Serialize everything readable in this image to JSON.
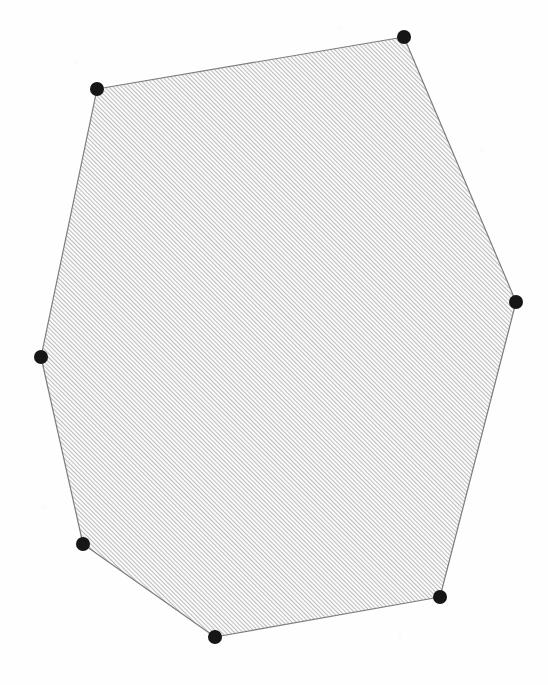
{
  "document": {
    "title": "Hatched Convex Polygon",
    "background_color": "#fefefe",
    "width": 548,
    "height": 685
  },
  "figure": {
    "name": "hatched-heptagon",
    "shape_type": "convex polygon",
    "vertex_count": 7,
    "fill_style": "diagonal-hatch",
    "hatch": {
      "angle_degrees": 45,
      "direction": "lower-left to upper-right",
      "spacing_px": 3,
      "line_width_px": 1.1,
      "line_color": "#8a8a8a",
      "background_color": "#fbfbfb"
    },
    "outline": {
      "color": "#7d7d7d",
      "width_px": 1.2,
      "style": "hand-drawn"
    },
    "vertex_marker": {
      "shape": "filled-circle",
      "color": "#141414",
      "radius_px": 7
    },
    "vertices": [
      {
        "label": "top-right",
        "x": 404,
        "y": 37
      },
      {
        "label": "right",
        "x": 516,
        "y": 302
      },
      {
        "label": "bottom-right",
        "x": 440,
        "y": 597
      },
      {
        "label": "bottom",
        "x": 215,
        "y": 637
      },
      {
        "label": "bottom-left",
        "x": 83,
        "y": 544
      },
      {
        "label": "left",
        "x": 41,
        "y": 357
      },
      {
        "label": "top-left",
        "x": 97,
        "y": 89
      }
    ]
  },
  "chart_data": {
    "type": "scatter",
    "title": "",
    "xlabel": "",
    "ylabel": "",
    "xlim": [
      0,
      548
    ],
    "ylim": [
      0,
      685
    ],
    "grid": false,
    "legend": "none",
    "annotations": [],
    "series": [
      {
        "name": "polygon-vertices",
        "marker": "filled-circle",
        "color": "#141414",
        "x": [
          404,
          516,
          440,
          215,
          83,
          41,
          97
        ],
        "y": [
          37,
          302,
          597,
          637,
          544,
          357,
          89
        ]
      }
    ]
  }
}
